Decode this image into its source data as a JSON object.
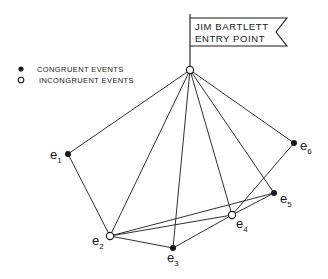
{
  "flag": {
    "line1": "JIM BARTLETT",
    "line2": "ENTRY POINT"
  },
  "legend": {
    "items": [
      {
        "symbol": "filled-circle",
        "label": "CONGRUENT EVENTS"
      },
      {
        "symbol": "open-circle",
        "label": "INCONGRUENT EVENTS"
      }
    ]
  },
  "nodes": [
    {
      "id": "entry",
      "label": "",
      "sub": "",
      "type": "incongruent"
    },
    {
      "id": "e1",
      "label": "e",
      "sub": "1",
      "type": "congruent"
    },
    {
      "id": "e2",
      "label": "e",
      "sub": "2",
      "type": "incongruent"
    },
    {
      "id": "e3",
      "label": "e",
      "sub": "3",
      "type": "congruent"
    },
    {
      "id": "e4",
      "label": "e",
      "sub": "4",
      "type": "incongruent"
    },
    {
      "id": "e5",
      "label": "e",
      "sub": "5",
      "type": "congruent"
    },
    {
      "id": "e6",
      "label": "e",
      "sub": "6",
      "type": "congruent"
    }
  ],
  "edges": [
    [
      "entry",
      "e1"
    ],
    [
      "entry",
      "e2"
    ],
    [
      "entry",
      "e3"
    ],
    [
      "entry",
      "e4"
    ],
    [
      "entry",
      "e5"
    ],
    [
      "entry",
      "e6"
    ],
    [
      "e1",
      "e2"
    ],
    [
      "e2",
      "e3"
    ],
    [
      "e2",
      "e4"
    ],
    [
      "e2",
      "e5"
    ],
    [
      "e3",
      "e4"
    ],
    [
      "e4",
      "e5"
    ],
    [
      "e4",
      "e6"
    ]
  ],
  "colors": {
    "ink": "#1a1a1a",
    "background": "#ffffff"
  }
}
